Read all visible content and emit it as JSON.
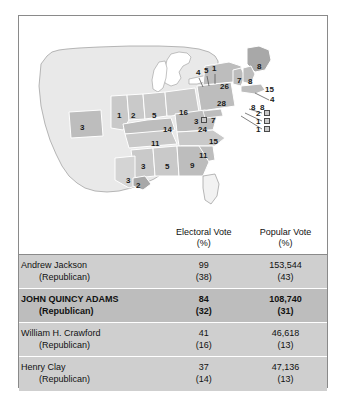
{
  "map": {
    "name": "united-states-electoral-map-1824",
    "colors": {
      "territory": "#e9e9e9",
      "state_light": "#d4d4d4",
      "state_mid": "#bdbdbd",
      "state_dark": "#a8a8a8",
      "outline": "#8a8a8a",
      "label": "#1a1a1a"
    },
    "state_labels": [
      {
        "id": "missouri",
        "value": "3",
        "x": 61,
        "y": 108
      },
      {
        "id": "illinois",
        "value": "1",
        "x": 98,
        "y": 96
      },
      {
        "id": "indiana",
        "value": "2",
        "x": 112,
        "y": 96
      },
      {
        "id": "ohio-west",
        "value": "5",
        "x": 133,
        "y": 96
      },
      {
        "id": "ohio",
        "value": "16",
        "x": 160,
        "y": 93
      },
      {
        "id": "pennsylvania",
        "value": "28",
        "x": 198,
        "y": 84
      },
      {
        "id": "new-york",
        "value": "26",
        "x": 201,
        "y": 67
      },
      {
        "id": "kentucky",
        "value": "14",
        "x": 144,
        "y": 110
      },
      {
        "id": "virginia",
        "value": "24",
        "x": 179,
        "y": 110
      },
      {
        "id": "tennessee",
        "value": "11",
        "x": 132,
        "y": 124
      },
      {
        "id": "north-carolina",
        "value": "15",
        "x": 190,
        "y": 122
      },
      {
        "id": "south-carolina",
        "value": "11",
        "x": 180,
        "y": 136
      },
      {
        "id": "mississippi",
        "value": "3",
        "x": 122,
        "y": 147
      },
      {
        "id": "alabama",
        "value": "5",
        "x": 146,
        "y": 147
      },
      {
        "id": "georgia",
        "value": "9",
        "x": 171,
        "y": 146
      },
      {
        "id": "louisiana",
        "value": "3",
        "x": 107,
        "y": 161
      },
      {
        "id": "louisiana-sub",
        "value": "2",
        "x": 117,
        "y": 166
      },
      {
        "id": "maine",
        "value": "8",
        "x": 238,
        "y": 47
      },
      {
        "id": "new-hampshire",
        "value": "7",
        "x": 218,
        "y": 61
      },
      {
        "id": "vermont",
        "value": "8",
        "x": 229,
        "y": 62
      },
      {
        "id": "massachusetts",
        "value": "15",
        "x": 246,
        "y": 70
      },
      {
        "id": "delaware-mark",
        "value": "3",
        "x": 175,
        "y": 102
      },
      {
        "id": "maryland",
        "value": "7",
        "x": 192,
        "y": 101
      }
    ],
    "callout_labels": [
      {
        "id": "michigan-area",
        "value": "4",
        "x": 177,
        "y": 57
      },
      {
        "id": "callout-5",
        "value": "5",
        "x": 186,
        "y": 55
      },
      {
        "id": "callout-1",
        "value": "1",
        "x": 194,
        "y": 53
      },
      {
        "id": "rhode-island",
        "value": "4",
        "x": 250,
        "y": 79
      },
      {
        "id": "connecticut",
        "value": "8",
        "x": 234,
        "y": 87
      },
      {
        "id": "new-jersey",
        "value": "8",
        "x": 243,
        "y": 87
      },
      {
        "id": "delaware",
        "value": "2",
        "x": 237,
        "y": 95
      },
      {
        "id": "maryland-box",
        "value": "1",
        "x": 237,
        "y": 103
      },
      {
        "id": "dc-box",
        "value": "1",
        "x": 237,
        "y": 111
      }
    ],
    "callout_boxes": [
      {
        "id": "box-delaware",
        "x": 245,
        "y": 94
      },
      {
        "id": "box-maryland",
        "x": 245,
        "y": 102
      },
      {
        "id": "box-dc",
        "x": 245,
        "y": 110
      },
      {
        "id": "box-inline",
        "x": 182,
        "y": 101
      }
    ]
  },
  "table": {
    "headers": {
      "candidate": "",
      "electoral": "Electoral Vote",
      "electoral_sub": "(%)",
      "popular": "Popular Vote",
      "popular_sub": "(%)"
    },
    "rows": [
      {
        "name": "Andrew Jackson",
        "party": "(Republican)",
        "electoral": "99",
        "electoral_pct": "(38)",
        "popular": "153,544",
        "popular_pct": "(43)",
        "winner": false
      },
      {
        "name": "JOHN QUINCY ADAMS",
        "party": "(Republican)",
        "electoral": "84",
        "electoral_pct": "(32)",
        "popular": "108,740",
        "popular_pct": "(31)",
        "winner": true
      },
      {
        "name": "William H. Crawford",
        "party": "(Republican)",
        "electoral": "41",
        "electoral_pct": "(16)",
        "popular": "46,618",
        "popular_pct": "(13)",
        "winner": false
      },
      {
        "name": "Henry Clay",
        "party": "(Republican)",
        "electoral": "37",
        "electoral_pct": "(14)",
        "popular": "47,136",
        "popular_pct": "(13)",
        "winner": false
      }
    ]
  }
}
